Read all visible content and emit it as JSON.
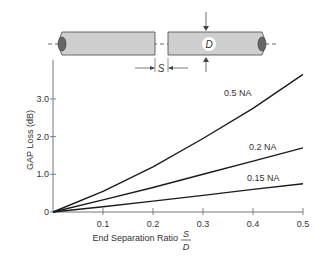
{
  "diagram": {
    "gap_label": "S",
    "diameter_label": "D"
  },
  "chart_data": {
    "type": "line",
    "title": "",
    "xlabel": "End Separation Ratio",
    "xlabel_fraction": {
      "numerator": "S",
      "denominator": "D"
    },
    "ylabel": "GAP Loss (dB)",
    "xlim": [
      0,
      0.5
    ],
    "ylim": [
      0,
      4.0
    ],
    "x_ticks": [
      "0.1",
      "0.2",
      "0.3",
      "0.4",
      "0.5"
    ],
    "y_ticks": [
      "0",
      "1.0",
      "2.0",
      "3.0"
    ],
    "grid": false,
    "legend": "inline labels",
    "x": [
      0,
      0.1,
      0.2,
      0.3,
      0.4,
      0.5
    ],
    "series": [
      {
        "name": "0.5 NA",
        "values": [
          0,
          0.55,
          1.2,
          1.95,
          2.75,
          3.65
        ]
      },
      {
        "name": "0.2 NA",
        "values": [
          0,
          0.32,
          0.65,
          1.0,
          1.35,
          1.7
        ]
      },
      {
        "name": "0.15 NA",
        "values": [
          0,
          0.14,
          0.29,
          0.44,
          0.6,
          0.75
        ]
      }
    ]
  }
}
